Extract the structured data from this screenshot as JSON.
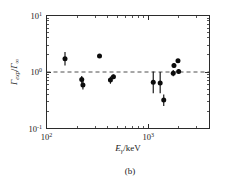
{
  "figure": {
    "caption": "(b)",
    "background_color": "#ffffff",
    "marker_color": "#0c0c0c",
    "axis_color": "#2b2b2b",
    "refline_color": "#3a3a3a"
  },
  "axes": {
    "x": {
      "title_main": "E",
      "title_sub": "γ",
      "title_unit": "/keV",
      "title_full": "Eγ/keV",
      "scale": "log",
      "min": 100,
      "max": 4000,
      "major_ticks": [
        {
          "value": 100,
          "mantissa": "10",
          "exponent": "2"
        },
        {
          "value": 1000,
          "mantissa": "10",
          "exponent": "3"
        }
      ]
    },
    "y": {
      "title_num": "Γ",
      "title_num_sub": "exp",
      "title_den": "Γ",
      "title_den_sub": "∞",
      "title_full": "Γexp/Γ∞",
      "scale": "log",
      "min": 0.1,
      "max": 10,
      "major_ticks": [
        {
          "value": 10,
          "mantissa": "10",
          "exponent": "1"
        },
        {
          "value": 1,
          "mantissa": "10",
          "exponent": "0"
        },
        {
          "value": 0.1,
          "mantissa": "10",
          "exponent": "-1"
        }
      ]
    }
  },
  "chart_data": {
    "type": "scatter",
    "title": "",
    "xlabel": "Eγ/keV",
    "ylabel": "Γexp/Γ∞",
    "xscale": "log",
    "yscale": "log",
    "xlim": [
      100,
      4000
    ],
    "ylim": [
      0.1,
      10
    ],
    "grid": false,
    "legend": null,
    "reference_line": {
      "y": 1.0,
      "style": "dashed",
      "label": "Γexp/Γ∞ = 1"
    },
    "marker_style": "filled-circle",
    "error_bars": "vertical",
    "points": [
      {
        "x": 152,
        "y": 1.72,
        "yerr_low": 0.42,
        "yerr_high": 0.55
      },
      {
        "x": 222,
        "y": 0.74,
        "yerr_low": 0.1,
        "yerr_high": 0.11
      },
      {
        "x": 228,
        "y": 0.59,
        "yerr_low": 0.1,
        "yerr_high": 0.1
      },
      {
        "x": 332,
        "y": 1.92,
        "yerr_low": 0.1,
        "yerr_high": 0.1
      },
      {
        "x": 425,
        "y": 0.72,
        "yerr_low": 0.1,
        "yerr_high": 0.11
      },
      {
        "x": 455,
        "y": 0.82,
        "yerr_low": 0.07,
        "yerr_high": 0.08
      },
      {
        "x": 1120,
        "y": 0.66,
        "yerr_low": 0.24,
        "yerr_high": 0.36
      },
      {
        "x": 1310,
        "y": 0.64,
        "yerr_low": 0.22,
        "yerr_high": 0.36
      },
      {
        "x": 1420,
        "y": 0.32,
        "yerr_low": 0.07,
        "yerr_high": 0.08
      },
      {
        "x": 1760,
        "y": 0.95,
        "yerr_low": 0.11,
        "yerr_high": 0.13
      },
      {
        "x": 1790,
        "y": 1.3,
        "yerr_low": 0.12,
        "yerr_high": 0.14
      },
      {
        "x": 1960,
        "y": 1.58,
        "yerr_low": 0.08,
        "yerr_high": 0.09
      },
      {
        "x": 1990,
        "y": 1.02,
        "yerr_low": 0.09,
        "yerr_high": 0.1
      }
    ]
  }
}
